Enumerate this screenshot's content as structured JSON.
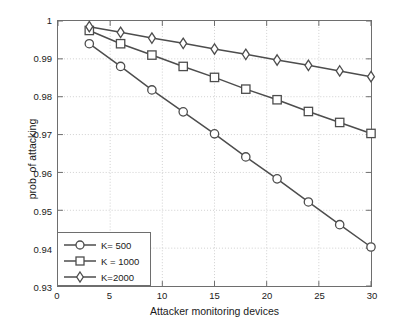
{
  "chart_data": {
    "type": "line",
    "title": "",
    "xlabel": "Attacker monitoring devices",
    "ylabel": "prob. of attacking",
    "xlim": [
      0,
      30
    ],
    "ylim": [
      0.93,
      1
    ],
    "xticks": [
      0,
      5,
      10,
      15,
      20,
      25,
      30
    ],
    "xtick_labels": [
      "0",
      "5",
      "10",
      "15",
      "20",
      "25",
      "30"
    ],
    "yticks": [
      0.93,
      0.94,
      0.95,
      0.96,
      0.97,
      0.98,
      0.99,
      1
    ],
    "ytick_labels": [
      "0.93",
      "0.94",
      "0.95",
      "0.96",
      "0.97",
      "0.98",
      "0.99",
      "1"
    ],
    "grid": true,
    "legend_position": "lower-left",
    "x": [
      3,
      6,
      9,
      12,
      15,
      18,
      21,
      24,
      27,
      30
    ],
    "series": [
      {
        "name": "K= 500",
        "marker": "circle",
        "color": "#4d4d4d",
        "values": [
          0.994,
          0.988,
          0.9818,
          0.976,
          0.9702,
          0.9641,
          0.9583,
          0.9522,
          0.9462,
          0.9403
        ]
      },
      {
        "name": "K = 1000",
        "marker": "square",
        "color": "#4d4d4d",
        "values": [
          0.9975,
          0.994,
          0.991,
          0.988,
          0.9851,
          0.982,
          0.9792,
          0.9761,
          0.9732,
          0.9703
        ]
      },
      {
        "name": "K=2000",
        "marker": "diamond",
        "color": "#4d4d4d",
        "values": [
          0.9985,
          0.997,
          0.9955,
          0.9941,
          0.9926,
          0.9912,
          0.9897,
          0.9883,
          0.9868,
          0.9853
        ]
      }
    ]
  },
  "legend": {
    "entries": [
      {
        "label": "K= 500"
      },
      {
        "label": "K = 1000"
      },
      {
        "label": "K=2000"
      }
    ]
  },
  "axes": {
    "x_title": "Attacker monitoring devices",
    "y_title": "prob. of attacking"
  },
  "style": {
    "line_color": "#4d4d4d",
    "axis_color": "#6e6e6e",
    "grid_color": "#d0d0d0",
    "background": "#ffffff"
  }
}
